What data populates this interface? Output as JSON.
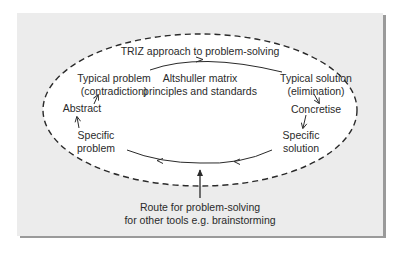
{
  "diagram": {
    "title": "TRIZ approach to problem-solving",
    "nodes": {
      "typical_problem": {
        "line1": "Typical problem",
        "line2": "(contradiction)"
      },
      "altshuller": {
        "line1": "Altshuller matrix",
        "line2": "principles and standards"
      },
      "typical_solution": {
        "line1": "Typical solution",
        "line2": "(elimination)"
      },
      "abstract": {
        "label": "Abstract"
      },
      "concretise": {
        "label": "Concretise"
      },
      "specific_problem": {
        "line1": "Specific",
        "line2": "problem"
      },
      "specific_solution": {
        "line1": "Specific",
        "line2": "solution"
      }
    },
    "route": {
      "line1": "Route for problem-solving",
      "line2": "for other tools e.g. brainstorming"
    },
    "colors": {
      "panel": "#ececec",
      "shadow": "#9a9a9a",
      "ellipse_fill": "#ffffff",
      "stroke": "#2a2a2a"
    }
  }
}
